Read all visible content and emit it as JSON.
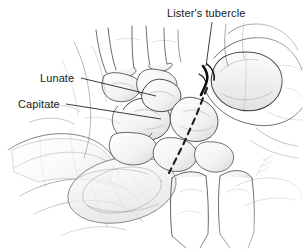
{
  "figure": {
    "style": "pencil line drawing",
    "background_color": "#ffffff",
    "ink_color": "#3a3a3a",
    "label_color": "#1a1a1a",
    "accent_dark_color": "#111111",
    "width": 303,
    "height": 251
  },
  "labels": [
    {
      "id": "listers-tubercle",
      "text": "Lister's tubercle",
      "x": 167,
      "y": 7,
      "leader": {
        "from_x": 212,
        "from_y": 22,
        "to_x": 206,
        "to_y": 66
      }
    },
    {
      "id": "lunate",
      "text": "Lunate",
      "x": 40,
      "y": 72,
      "leader": {
        "from_x": 81,
        "from_y": 79,
        "to_x": 156,
        "to_y": 96
      }
    },
    {
      "id": "capitate",
      "text": "Capitate",
      "x": 18,
      "y": 98,
      "leader": {
        "from_x": 66,
        "from_y": 105,
        "to_x": 161,
        "to_y": 119
      }
    }
  ],
  "annotations": {
    "dashed_line": {
      "name": "surgical-approach-dashed-line",
      "description": "dashed line running from Lister's tubercle area distally-radially across the carpus",
      "points": "207,88 195,118 182,146 169,173",
      "dash_pattern": "6 5"
    },
    "dark_marking": {
      "name": "listers-tubercle-marking",
      "description": "heavy dark ink marking on the dorsal rim at Lister's tubercle"
    },
    "artist_signature": {
      "name": "artist-signature",
      "description": "faint hand-written signature, illegible",
      "x": 258,
      "y": 160
    }
  },
  "anatomy_regions": [
    {
      "id": "metacarpals",
      "label": "metacarpal bases"
    },
    {
      "id": "carpal-row-distal",
      "label": "distal carpal row"
    },
    {
      "id": "carpal-row-proximal",
      "label": "proximal carpal row"
    },
    {
      "id": "radius",
      "label": "distal radius"
    },
    {
      "id": "ulna",
      "label": "distal ulna"
    },
    {
      "id": "examiner-hands",
      "label": "examiner hands grasping wrist"
    },
    {
      "id": "thumb-right",
      "label": "examiner thumb over dorsal wrist"
    }
  ]
}
